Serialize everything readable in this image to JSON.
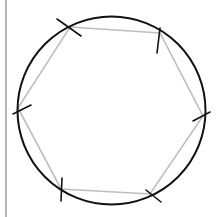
{
  "diagram": {
    "type": "geometric-construction",
    "canvas": {
      "width": 222,
      "height": 217,
      "background": "#ffffff"
    },
    "colors": {
      "circle": "#111111",
      "hexagon": "#bdbdbd",
      "ticks": "#111111",
      "border": "#9e9e9e"
    },
    "border_line": {
      "x": 6,
      "y1": 0,
      "y2": 217
    },
    "circle": {
      "cx": 111.5,
      "cy": 110.5,
      "r": 94,
      "stroke_width": 2
    },
    "hexagon": {
      "stroke_width": 1.6,
      "vertices": [
        {
          "id": "v1",
          "x": 70,
          "y": 27
        },
        {
          "id": "v2",
          "x": 160,
          "y": 33
        },
        {
          "id": "v3",
          "x": 203,
          "y": 116
        },
        {
          "id": "v4",
          "x": 150,
          "y": 194
        },
        {
          "id": "v5",
          "x": 61,
          "y": 189
        },
        {
          "id": "v6",
          "x": 18,
          "y": 108
        }
      ]
    },
    "compass_marks": [
      {
        "vertex": "v1",
        "x1": 57,
        "y1": 19,
        "x2": 81,
        "y2": 36
      },
      {
        "vertex": "v2",
        "x1": 160,
        "y1": 28,
        "x2": 157,
        "y2": 53
      },
      {
        "vertex": "v3",
        "x1": 193,
        "y1": 121,
        "x2": 210,
        "y2": 112
      },
      {
        "vertex": "v4",
        "x1": 146,
        "y1": 190,
        "x2": 161,
        "y2": 202
      },
      {
        "vertex": "v5",
        "x1": 62,
        "y1": 178,
        "x2": 61,
        "y2": 201
      },
      {
        "vertex": "v6",
        "x1": 13,
        "y1": 114,
        "x2": 31,
        "y2": 105
      }
    ]
  }
}
